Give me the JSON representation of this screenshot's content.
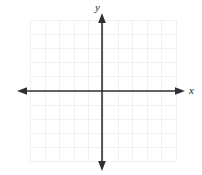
{
  "figure": {
    "name": "blank-cartesian-coordinate-plane",
    "width": 202,
    "height": 175,
    "background_color": "#ffffff"
  },
  "axes": {
    "x_axis": {
      "label": "x",
      "color": "#2f2f2f",
      "position_y": 91,
      "start_x": 18,
      "end_x": 184,
      "arrowheads": [
        "left",
        "right"
      ],
      "stroke_width": 1.6
    },
    "y_axis": {
      "label": "y",
      "color": "#2f2f2f",
      "position_x": 102,
      "start_y": 14,
      "end_y": 170,
      "arrowheads": [
        "up",
        "down"
      ],
      "stroke_width": 1.6
    },
    "origin": {
      "x": 102,
      "y": 91
    }
  },
  "grid": {
    "color": "#f1f1f1",
    "left": 30,
    "top": 20,
    "width": 146,
    "height": 141,
    "columns": 10,
    "rows": 10,
    "cell_width": 14.6,
    "cell_height": 14.1,
    "visible": true
  },
  "chart_data": {
    "type": "scatter",
    "title": "",
    "subtitle": "",
    "xlabel": "x",
    "ylabel": "y",
    "xlim": [
      -5,
      5
    ],
    "ylim": [
      -5,
      5
    ],
    "xticks": [
      -5,
      -4,
      -3,
      -2,
      -1,
      0,
      1,
      2,
      3,
      4,
      5
    ],
    "yticks": [
      -5,
      -4,
      -3,
      -2,
      -1,
      0,
      1,
      2,
      3,
      4,
      5
    ],
    "xtick_labels": [],
    "ytick_labels": [],
    "grid": true,
    "legend": null,
    "series": [],
    "annotations": []
  }
}
